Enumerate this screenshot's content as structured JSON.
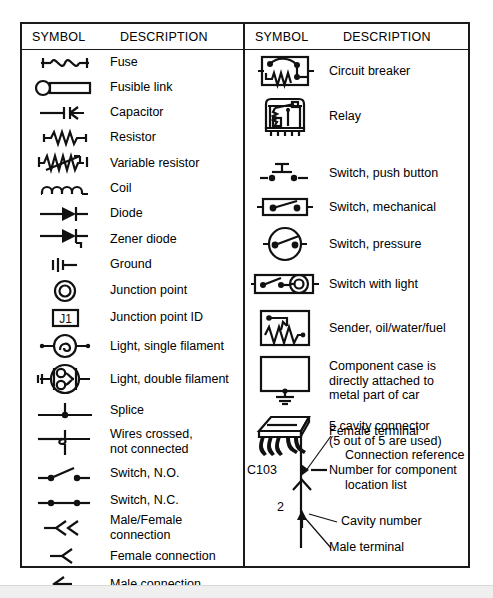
{
  "figure": {
    "border_color": "#1a1a1a",
    "background": "#ffffff"
  },
  "columns": [
    {
      "id": "left-column",
      "header": {
        "symbol": "SYMBOL",
        "description": "DESCRIPTION"
      },
      "rows": [
        {
          "icon": "fuse-icon",
          "label": "Fuse"
        },
        {
          "icon": "fusible-link-icon",
          "label": "Fusible link"
        },
        {
          "icon": "capacitor-icon",
          "label": "Capacitor"
        },
        {
          "icon": "resistor-icon",
          "label": "Resistor"
        },
        {
          "icon": "variable-resistor-icon",
          "label": "Variable resistor"
        },
        {
          "icon": "coil-icon",
          "label": "Coil"
        },
        {
          "icon": "diode-icon",
          "label": "Diode"
        },
        {
          "icon": "zener-diode-icon",
          "label": "Zener diode"
        },
        {
          "icon": "ground-icon",
          "label": "Ground"
        },
        {
          "icon": "junction-point-icon",
          "label": "Junction point"
        },
        {
          "icon": "junction-point-id-icon",
          "label": "Junction point ID",
          "icon_text": "J1"
        },
        {
          "icon": "light-single-filament-icon",
          "label": "Light, single filament"
        },
        {
          "icon": "light-double-filament-icon",
          "label": "Light, double filament"
        },
        {
          "icon": "splice-icon",
          "label": "Splice"
        },
        {
          "icon": "wires-crossed-icon",
          "label": "Wires crossed,\nnot connected"
        },
        {
          "icon": "switch-no-icon",
          "label": "Switch, N.O."
        },
        {
          "icon": "switch-nc-icon",
          "label": "Switch, N.C."
        },
        {
          "icon": "male-female-connection-icon",
          "label": "Male/Female connection"
        },
        {
          "icon": "female-connection-icon",
          "label": "Female connection"
        },
        {
          "icon": "male-connection-icon",
          "label": "Male connection"
        }
      ]
    },
    {
      "id": "right-column",
      "header": {
        "symbol": "SYMBOL",
        "description": "DESCRIPTION"
      },
      "rows": [
        {
          "icon": "circuit-breaker-icon",
          "label": "Circuit breaker"
        },
        {
          "icon": "relay-icon",
          "label": "Relay"
        },
        {
          "icon": "switch-push-button-icon",
          "label": "Switch, push button"
        },
        {
          "icon": "switch-mechanical-icon",
          "label": "Switch, mechanical"
        },
        {
          "icon": "switch-pressure-icon",
          "label": "Switch, pressure"
        },
        {
          "icon": "switch-with-light-icon",
          "label": "Switch with light"
        },
        {
          "icon": "sender-icon",
          "label": "Sender, oil/water/fuel"
        },
        {
          "icon": "component-case-ground-icon",
          "label": "Component case is\ndirectly attached to\nmetal part of car"
        },
        {
          "icon": "cavity-connector-icon",
          "label": "5 cavity connector\n(5 out of 5 are used)"
        }
      ],
      "connector_annotation": {
        "connector_id": "C103",
        "cavity_number": "2",
        "callouts": [
          "Female terminal",
          "Connection reference",
          "Number for component",
          "location list",
          "Cavity number",
          "Male terminal"
        ]
      }
    }
  ]
}
